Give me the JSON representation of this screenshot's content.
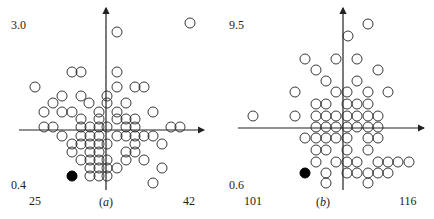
{
  "chart_data": [
    {
      "type": "scatter",
      "panel_label": "(a)",
      "panel_letter": "a",
      "y_top_label": "3.0",
      "y_bottom_label": "0.4",
      "x_left_label": "25",
      "x_right_label": "42",
      "ylim": [
        0.4,
        3.0
      ],
      "xlim": [
        25,
        42
      ],
      "marker": "open-circle",
      "highlight_marker": "filled-circle",
      "axes_cross_px": [
        106,
        130
      ],
      "points_px": [
        [
          190,
          23
        ],
        [
          117,
          32
        ],
        [
          72,
          72
        ],
        [
          81,
          72
        ],
        [
          117,
          72
        ],
        [
          35,
          87
        ],
        [
          117,
          87
        ],
        [
          135,
          87
        ],
        [
          144,
          87
        ],
        [
          62,
          96
        ],
        [
          81,
          96
        ],
        [
          107,
          96
        ],
        [
          53,
          103
        ],
        [
          89,
          103
        ],
        [
          107,
          103
        ],
        [
          126,
          103
        ],
        [
          44,
          112
        ],
        [
          62,
          112
        ],
        [
          72,
          112
        ],
        [
          99,
          112
        ],
        [
          117,
          112
        ],
        [
          153,
          112
        ],
        [
          81,
          119
        ],
        [
          99,
          119
        ],
        [
          117,
          119
        ],
        [
          126,
          119
        ],
        [
          135,
          119
        ],
        [
          44,
          127
        ],
        [
          53,
          127
        ],
        [
          81,
          127
        ],
        [
          90,
          127
        ],
        [
          99,
          127
        ],
        [
          107,
          127
        ],
        [
          126,
          127
        ],
        [
          135,
          127
        ],
        [
          171,
          127
        ],
        [
          180,
          127
        ],
        [
          62,
          136
        ],
        [
          81,
          136
        ],
        [
          90,
          136
        ],
        [
          99,
          136
        ],
        [
          117,
          136
        ],
        [
          126,
          136
        ],
        [
          135,
          136
        ],
        [
          144,
          136
        ],
        [
          153,
          136
        ],
        [
          72,
          144
        ],
        [
          81,
          144
        ],
        [
          90,
          144
        ],
        [
          99,
          144
        ],
        [
          107,
          144
        ],
        [
          135,
          144
        ],
        [
          162,
          144
        ],
        [
          72,
          152
        ],
        [
          90,
          152
        ],
        [
          99,
          152
        ],
        [
          126,
          152
        ],
        [
          135,
          152
        ],
        [
          81,
          160
        ],
        [
          90,
          160
        ],
        [
          99,
          160
        ],
        [
          107,
          160
        ],
        [
          126,
          160
        ],
        [
          144,
          160
        ],
        [
          90,
          168
        ],
        [
          99,
          168
        ],
        [
          107,
          168
        ],
        [
          117,
          168
        ],
        [
          162,
          168
        ],
        [
          90,
          176
        ],
        [
          99,
          176
        ],
        [
          107,
          176
        ],
        [
          153,
          183
        ]
      ],
      "highlight_px": [
        72,
        176
      ]
    },
    {
      "type": "scatter",
      "panel_label": "(b)",
      "panel_letter": "b",
      "y_top_label": "9.5",
      "y_bottom_label": "0.6",
      "x_left_label": "101",
      "x_right_label": "116",
      "ylim": [
        0.6,
        9.5
      ],
      "xlim": [
        101,
        116
      ],
      "marker": "open-circle",
      "highlight_marker": "filled-circle",
      "axes_cross_px": [
        343,
        128
      ],
      "points_px": [
        [
          368,
          24
        ],
        [
          348,
          36
        ],
        [
          305,
          59
        ],
        [
          336,
          59
        ],
        [
          357,
          59
        ],
        [
          316,
          70
        ],
        [
          378,
          70
        ],
        [
          326,
          81
        ],
        [
          357,
          81
        ],
        [
          295,
          92
        ],
        [
          336,
          92
        ],
        [
          347,
          92
        ],
        [
          368,
          92
        ],
        [
          388,
          92
        ],
        [
          316,
          104
        ],
        [
          326,
          104
        ],
        [
          347,
          104
        ],
        [
          357,
          104
        ],
        [
          368,
          104
        ],
        [
          253,
          116
        ],
        [
          295,
          116
        ],
        [
          316,
          116
        ],
        [
          326,
          116
        ],
        [
          336,
          116
        ],
        [
          347,
          116
        ],
        [
          357,
          116
        ],
        [
          368,
          116
        ],
        [
          378,
          116
        ],
        [
          316,
          127
        ],
        [
          326,
          127
        ],
        [
          336,
          127
        ],
        [
          347,
          127
        ],
        [
          357,
          127
        ],
        [
          368,
          127
        ],
        [
          378,
          127
        ],
        [
          305,
          138
        ],
        [
          316,
          138
        ],
        [
          326,
          138
        ],
        [
          336,
          138
        ],
        [
          347,
          138
        ],
        [
          368,
          138
        ],
        [
          378,
          138
        ],
        [
          316,
          150
        ],
        [
          326,
          150
        ],
        [
          347,
          150
        ],
        [
          368,
          150
        ],
        [
          316,
          162
        ],
        [
          336,
          162
        ],
        [
          347,
          162
        ],
        [
          357,
          162
        ],
        [
          378,
          162
        ],
        [
          388,
          162
        ],
        [
          398,
          162
        ],
        [
          409,
          162
        ],
        [
          326,
          173
        ],
        [
          347,
          173
        ],
        [
          357,
          173
        ],
        [
          368,
          173
        ],
        [
          378,
          173
        ],
        [
          388,
          173
        ],
        [
          326,
          183
        ],
        [
          368,
          183
        ]
      ],
      "highlight_px": [
        305,
        173
      ]
    }
  ],
  "colors": {
    "ink": "#222222",
    "background": "#ffffff"
  }
}
